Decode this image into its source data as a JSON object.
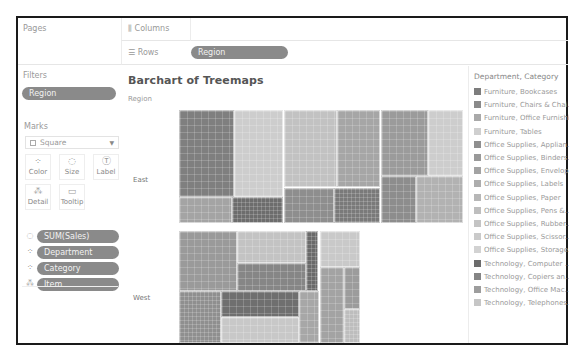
{
  "shelves": {
    "pages_label": "Pages",
    "columns_label": "Columns",
    "columns_icon": "columns-icon",
    "rows_label": "Rows",
    "rows_icon": "rows-icon",
    "rows_pill": "Region",
    "filters_label": "Filters",
    "filters_pill": "Region"
  },
  "marks": {
    "label": "Marks",
    "mark_type": "Square",
    "buttons": [
      {
        "label": "Color",
        "icon": "color-icon",
        "glyph": "⁘"
      },
      {
        "label": "Size",
        "icon": "size-icon",
        "glyph": "◌"
      },
      {
        "label": "Label",
        "icon": "label-icon",
        "glyph": "Ⓣ"
      },
      {
        "label": "Detail",
        "icon": "detail-icon",
        "glyph": "⁂"
      },
      {
        "label": "Tooltip",
        "icon": "tooltip-icon",
        "glyph": "▭"
      }
    ],
    "fields": [
      {
        "label": "SUM(Sales)",
        "icon": "size-icon",
        "glyph": "◌"
      },
      {
        "label": "Department",
        "icon": "color-icon",
        "glyph": "⁘"
      },
      {
        "label": "Category",
        "icon": "color-icon",
        "glyph": "⁘"
      },
      {
        "label": "Item",
        "icon": "detail-icon",
        "glyph": "⁂"
      }
    ]
  },
  "view": {
    "title": "Barchart of Treemaps",
    "row_header": "Region",
    "rows": [
      "East",
      "West"
    ]
  },
  "legend": {
    "title": "Department, Category",
    "items": [
      {
        "label": "Furniture, Bookcases",
        "color": "#7d7d7d"
      },
      {
        "label": "Furniture, Chairs & Chai...",
        "color": "#8a8a8a"
      },
      {
        "label": "Furniture, Office Furnishi...",
        "color": "#a9a9a9"
      },
      {
        "label": "Furniture, Tables",
        "color": "#cfcfcf"
      },
      {
        "label": "Office Supplies, Applian...",
        "color": "#8f8f8f"
      },
      {
        "label": "Office Supplies, Binders...",
        "color": "#999999"
      },
      {
        "label": "Office Supplies, Envelop...",
        "color": "#a3a3a3"
      },
      {
        "label": "Office Supplies, Labels",
        "color": "#adadad"
      },
      {
        "label": "Office Supplies, Paper",
        "color": "#b7b7b7"
      },
      {
        "label": "Office Supplies, Pens &...",
        "color": "#bebebe"
      },
      {
        "label": "Office Supplies, Rubber...",
        "color": "#c4c4c4"
      },
      {
        "label": "Office Supplies, Scissor...",
        "color": "#cacaca"
      },
      {
        "label": "Office Supplies, Storage...",
        "color": "#d2d2d2"
      },
      {
        "label": "Technology, Computer ...",
        "color": "#6c6c6c"
      },
      {
        "label": "Technology, Copiers an...",
        "color": "#858585"
      },
      {
        "label": "Technology, Office Mac...",
        "color": "#9d9d9d"
      },
      {
        "label": "Technology, Telephones...",
        "color": "#c6c6c6"
      }
    ]
  }
}
